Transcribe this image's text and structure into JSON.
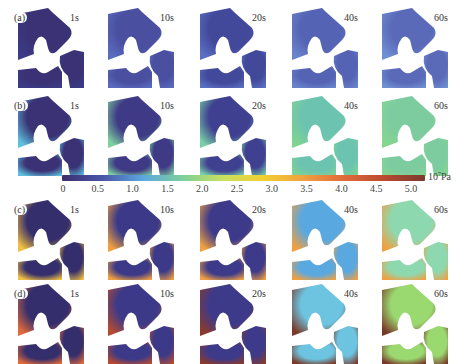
{
  "figure": {
    "rows": [
      {
        "label": "(a)",
        "times": [
          "1s",
          "10s",
          "20s",
          "40s",
          "60s"
        ]
      },
      {
        "label": "(b)",
        "times": [
          "1s",
          "10s",
          "20s",
          "40s",
          "60s"
        ]
      },
      {
        "label": "(c)",
        "times": [
          "1s",
          "10s",
          "20s",
          "40s",
          "60s"
        ]
      },
      {
        "label": "(d)",
        "times": [
          "1s",
          "10s",
          "20s",
          "40s",
          "60s"
        ]
      }
    ],
    "colorbar": {
      "ticks": [
        "0",
        "0.5",
        "1.0",
        "1.5",
        "2.0",
        "2.5",
        "3.0",
        "3.5",
        "4.0",
        "4.5",
        "5.0"
      ],
      "unit_base": "10",
      "unit_exp": "7",
      "unit_suffix": "Pa",
      "colors": [
        "#3b2f6e",
        "#4a55a8",
        "#5aa8e0",
        "#7ecf9a",
        "#c8e060",
        "#f2d030",
        "#f0a040",
        "#e06a3a",
        "#b84a30",
        "#7a3a2a"
      ]
    }
  }
}
